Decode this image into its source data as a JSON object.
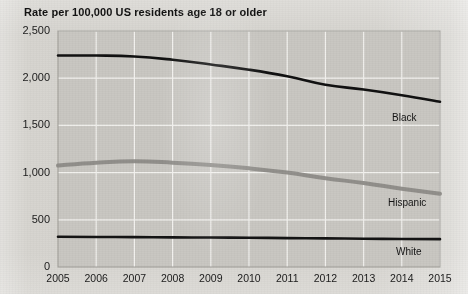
{
  "title": "Rate per 100,000 US residents age 18 or older",
  "axis": {
    "y_ticks": [
      "2,500",
      "2,000",
      "1,500",
      "1,000",
      "500",
      "0"
    ],
    "x_ticks": [
      "2005",
      "2006",
      "2007",
      "2008",
      "2009",
      "2010",
      "2011",
      "2012",
      "2013",
      "2014",
      "2015"
    ]
  },
  "series_labels": {
    "black": "Black",
    "hispanic": "Hispanic",
    "white": "White"
  },
  "colors": {
    "plot_background": "#c9c7c2",
    "page_background": "#d6d4cf",
    "gridline": "#f2f1ee",
    "black_line": "#111111",
    "hispanic_line": "#8e8c88",
    "white_line": "#141414",
    "text": "#1b1b1b"
  },
  "chart_data": {
    "type": "line",
    "title": "Rate per 100,000 US residents age 18 or older",
    "xlabel": "",
    "ylabel": "Rate per 100,000 US residents age 18 or older",
    "x": [
      2005,
      2006,
      2007,
      2008,
      2009,
      2010,
      2011,
      2012,
      2013,
      2014,
      2015
    ],
    "ylim": [
      0,
      2500
    ],
    "yticks": [
      0,
      500,
      1000,
      1500,
      2000,
      2500
    ],
    "grid": true,
    "legend": "inline-labels-right",
    "series": [
      {
        "name": "Black",
        "color": "#111111",
        "values": [
          2240,
          2240,
          2230,
          2195,
          2145,
          2090,
          2020,
          1930,
          1880,
          1820,
          1750
        ]
      },
      {
        "name": "Hispanic",
        "color": "#8e8c88",
        "values": [
          1075,
          1105,
          1120,
          1105,
          1080,
          1045,
          1000,
          940,
          890,
          830,
          775
        ]
      },
      {
        "name": "White",
        "color": "#141414",
        "values": [
          320,
          318,
          316,
          314,
          312,
          310,
          306,
          303,
          300,
          297,
          295
        ]
      }
    ]
  }
}
